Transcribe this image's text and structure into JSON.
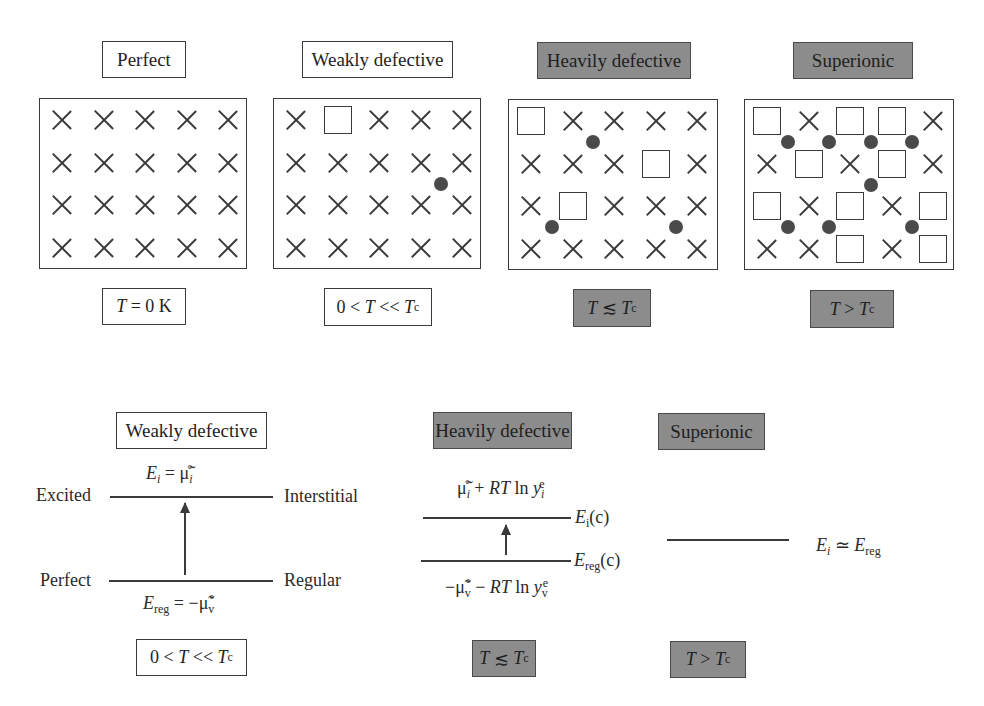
{
  "top_row": {
    "panels": [
      {
        "title": "Perfect",
        "style": "white",
        "condition": "T = 0 K",
        "condition_parts": {
          "pre": "",
          "var": "T",
          "mid": " = 0 K",
          "var2": "",
          "sub": ""
        }
      },
      {
        "title": "Weakly defective",
        "style": "white",
        "condition": "0 < T << Tc",
        "condition_parts": {
          "pre": "0 < ",
          "var": "T",
          "mid": " << ",
          "var2": "T",
          "sub": "c"
        }
      },
      {
        "title": "Heavily defective",
        "style": "gray",
        "condition": "T ≲ Tc",
        "condition_parts": {
          "pre": "",
          "var": "T",
          "mid": " ≲ ",
          "var2": "T",
          "sub": "c"
        }
      },
      {
        "title": "Superionic",
        "style": "gray",
        "condition": "T > Tc",
        "condition_parts": {
          "pre": "",
          "var": "T",
          "mid": " > ",
          "var2": "T",
          "sub": "c"
        }
      }
    ],
    "lattices": [
      {
        "name": "perfect",
        "grid": [
          [
            "x",
            "x",
            "x",
            "x",
            "x"
          ],
          [
            "x",
            "x",
            "x",
            "x",
            "x"
          ],
          [
            "x",
            "x",
            "x",
            "x",
            "x"
          ],
          [
            "x",
            "x",
            "x",
            "x",
            "x"
          ]
        ],
        "ions": []
      },
      {
        "name": "weakly-defective",
        "grid": [
          [
            "x",
            "v",
            "x",
            "x",
            "x"
          ],
          [
            "x",
            "x",
            "x",
            "x",
            "x"
          ],
          [
            "x",
            "x",
            "x",
            "x",
            "x"
          ],
          [
            "x",
            "x",
            "x",
            "x",
            "x"
          ]
        ],
        "ions": [
          [
            3.5,
            1.5
          ]
        ]
      },
      {
        "name": "heavily-defective",
        "grid": [
          [
            "v",
            "x",
            "x",
            "x",
            "x"
          ],
          [
            "x",
            "x",
            "x",
            "v",
            "x"
          ],
          [
            "x",
            "v",
            "x",
            "x",
            "x"
          ],
          [
            "x",
            "x",
            "x",
            "x",
            "x"
          ]
        ],
        "ions": [
          [
            1.5,
            0.5
          ],
          [
            0.5,
            2.5
          ],
          [
            3.5,
            2.5
          ]
        ]
      },
      {
        "name": "superionic",
        "grid": [
          [
            "v",
            "x",
            "v",
            "v",
            "x"
          ],
          [
            "x",
            "v",
            "x",
            "v",
            "x"
          ],
          [
            "v",
            "x",
            "v",
            "x",
            "v"
          ],
          [
            "x",
            "x",
            "v",
            "x",
            "v"
          ]
        ],
        "ions": [
          [
            0.5,
            0.5
          ],
          [
            1.5,
            0.5
          ],
          [
            2.5,
            0.5
          ],
          [
            3.5,
            0.5
          ],
          [
            2.5,
            1.5
          ],
          [
            0.5,
            2.5
          ],
          [
            1.5,
            2.5
          ],
          [
            3.5,
            2.5
          ]
        ]
      }
    ],
    "legend_symbols": {
      "x": "regular-lattice-site",
      "v": "vacancy",
      "ion": "interstitial-ion"
    }
  },
  "bottom_row": {
    "weakly": {
      "title": "Weakly defective",
      "upper_energy": {
        "E": "E",
        "sub": "i",
        "eq": " = ",
        "mu": "μ̃",
        "mu_sub": "i",
        "mu_sup": "°"
      },
      "upper_left": "Excited",
      "upper_right": "Interstitial",
      "lower_left": "Perfect",
      "lower_right": "Regular",
      "lower_energy": {
        "E": "E",
        "sub": "reg",
        "eq": " = −",
        "mu": "μ̃",
        "mu_sub": "v",
        "mu_sup": "°"
      },
      "condition": {
        "pre": "0 < ",
        "var": "T",
        "mid": " << ",
        "var2": "T",
        "sub": "c"
      }
    },
    "heavily": {
      "title": "Heavily defective",
      "upper_expr": {
        "mu": "μ̃",
        "mu_sub": "i",
        "mu_sup": "°",
        "rest": " + ",
        "RT": "RT",
        "ln": " ln ",
        "y": "y",
        "y_sub": "i",
        "y_sup": "e"
      },
      "upper_level": {
        "E": "E",
        "sub": "i",
        "suffix": "(c)"
      },
      "lower_level": {
        "E": "E",
        "sub": "reg",
        "suffix": "(c)"
      },
      "lower_expr": {
        "pre": "−",
        "mu": "μ̃",
        "mu_sub": "v",
        "mu_sup": "°",
        "rest": " − ",
        "RT": "RT",
        "ln": " ln ",
        "y": "y",
        "y_sub": "v",
        "y_sup": "e"
      },
      "condition": {
        "pre": "",
        "var": "T",
        "mid": " ≲ ",
        "var2": "T",
        "sub": "c"
      }
    },
    "superionic": {
      "title": "Superionic",
      "level": {
        "E1": "E",
        "sub1": "i",
        "op": " ≃ ",
        "E2": "E",
        "sub2": "reg"
      },
      "condition": {
        "pre": "",
        "var": "T",
        "mid": " > ",
        "var2": "T",
        "sub": "c"
      }
    }
  },
  "colors": {
    "gray_box": "#8c8c8c",
    "line": "#3a3a3a",
    "ion": "#4a4a4a",
    "background": "#ffffff"
  }
}
